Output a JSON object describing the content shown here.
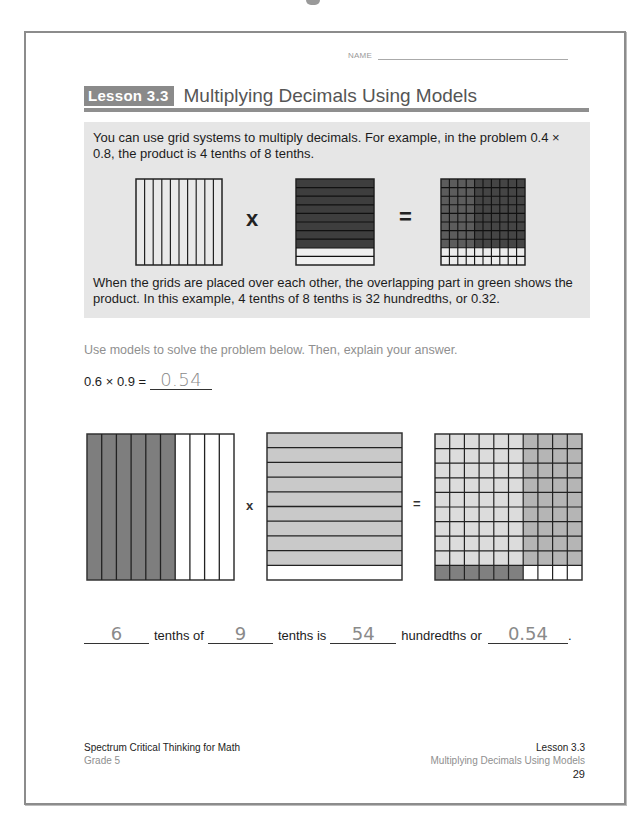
{
  "header": {
    "name_label": "NAME",
    "lesson_badge": "Lesson 3.3",
    "lesson_title": "Multiplying Decimals Using Models"
  },
  "info_box": {
    "intro_text": "You can use grid systems to multiply decimals. For example, in the problem 0.4 × 0.8, the product is 4 tenths of 8 tenths.",
    "explanation_text": "When the grids are placed over each other, the overlapping part in green shows the product. In this example, 4 tenths of 8 tenths is 32 hundredths, or 0.32.",
    "example": {
      "times_symbol": "x",
      "equals_symbol": "=",
      "grid1": {
        "columns": 10,
        "rows": 1,
        "description": "10 vertical columns"
      },
      "grid2": {
        "rows": 10,
        "shaded_rows": 8,
        "description": "8 of 10 horizontal rows shaded"
      },
      "grid3": {
        "rows": 10,
        "columns": 10,
        "shaded_rows": 8,
        "description": "10x10 grid, top 8 rows shaded"
      }
    }
  },
  "problem": {
    "instructions": "Use models to solve the problem below. Then, explain your answer.",
    "equation": "0.6 × 0.9 =",
    "answer": "0.54"
  },
  "models": {
    "times_symbol": "x",
    "equals_symbol": "=",
    "grid1": {
      "columns": 10,
      "shaded_columns": 6
    },
    "grid2": {
      "rows": 10,
      "shaded_rows": 9
    },
    "grid3": {
      "rows": 10,
      "columns": 10,
      "left_columns": 6,
      "top_rows": 9
    }
  },
  "sentence": {
    "blank1": "6",
    "text1": "tenths of",
    "blank2": "9",
    "text2": "tenths is",
    "blank3": "54",
    "text3": "hundredths",
    "text4": "or",
    "blank4": "0.54",
    "end": "."
  },
  "footer": {
    "series": "Spectrum Critical Thinking for Math",
    "grade": "Grade 5",
    "lesson": "Lesson 3.3",
    "subtitle": "Multiplying Decimals Using Models",
    "page": "29"
  },
  "colors": {
    "badge": "#8a8a8a",
    "info_box_bg": "#e6e6e6",
    "dark_shade": "#7e7e7e",
    "light_shade": "#c9c9c9",
    "overlap_light": "#dcdcdc",
    "overlap_mid": "#b5b5b5",
    "handwriting": "#8a8a8a"
  }
}
